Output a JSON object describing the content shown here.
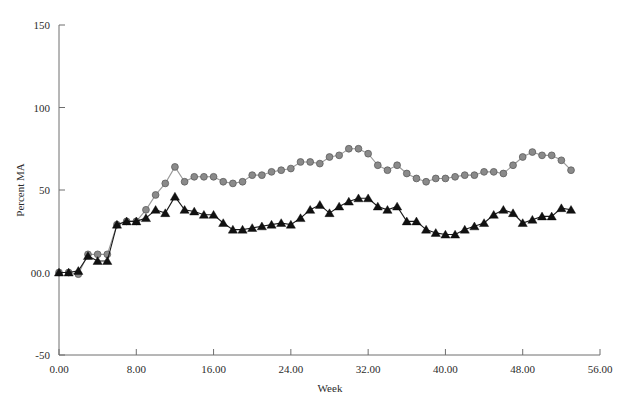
{
  "chart_data": {
    "type": "line",
    "title": "",
    "xlabel": "Week",
    "ylabel": "Percent MA",
    "xlim": [
      0,
      56
    ],
    "ylim": [
      -50,
      150
    ],
    "grid": false,
    "legend": "none",
    "xticks": [
      "0.00",
      "8.00",
      "16.00",
      "24.00",
      "32.00",
      "40.00",
      "48.00",
      "56.00"
    ],
    "xtick_values": [
      0,
      8,
      16,
      24,
      32,
      40,
      48,
      56
    ],
    "yticks": [
      "150",
      "100",
      "50",
      "00.0",
      "-50"
    ],
    "ytick_values": [
      150,
      100,
      50,
      0,
      -50
    ],
    "colors": {
      "series_circle_marker": "#8a8a8a",
      "series_circle_line": "#9a9a9a",
      "series_triangle_marker": "#111111",
      "series_triangle_line": "#1a1a1a",
      "axis": "#6e6e6e",
      "text": "#2b2b2b"
    },
    "x": [
      0,
      1,
      2,
      3,
      4,
      5,
      6,
      7,
      8,
      9,
      10,
      11,
      12,
      13,
      14,
      15,
      16,
      17,
      18,
      19,
      20,
      21,
      22,
      23,
      24,
      25,
      26,
      27,
      28,
      29,
      30,
      31,
      32,
      33,
      34,
      35,
      36,
      37,
      38,
      39,
      40,
      41,
      42,
      43,
      44,
      45,
      46,
      47,
      48,
      49,
      50,
      51,
      52,
      53
    ],
    "series": [
      {
        "name": "Percent MA (circle series)",
        "marker": "circle",
        "values": [
          0,
          0,
          -1,
          11,
          11,
          11,
          29,
          31,
          31,
          38,
          47,
          54,
          64,
          55,
          58,
          58,
          58,
          55,
          54,
          55,
          59,
          59,
          61,
          62,
          63,
          67,
          67,
          66,
          70,
          71,
          75,
          75,
          72,
          65,
          62,
          65,
          60,
          57,
          55,
          57,
          57,
          58,
          59,
          59,
          61,
          61,
          60,
          65,
          70,
          73,
          71,
          71,
          68,
          62
        ]
      },
      {
        "name": "Percent MA (triangle series)",
        "marker": "triangle",
        "values": [
          0,
          0,
          1,
          10,
          7,
          7,
          29,
          31,
          31,
          33,
          38,
          36,
          46,
          38,
          37,
          35,
          35,
          30,
          26,
          26,
          27,
          28,
          29,
          30,
          29,
          33,
          38,
          41,
          36,
          40,
          43,
          45,
          45,
          40,
          38,
          40,
          31,
          31,
          26,
          24,
          23,
          23,
          26,
          28,
          30,
          35,
          38,
          36,
          30,
          32,
          34,
          34,
          39,
          38
        ]
      }
    ]
  },
  "annotations": []
}
